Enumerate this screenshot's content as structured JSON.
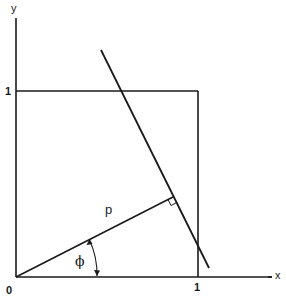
{
  "diagram": {
    "type": "geometry",
    "colors": {
      "stroke": "#1a1a1a",
      "background": "#ffffff"
    },
    "axes": {
      "x_label": "x",
      "y_label": "y",
      "origin_label": "0"
    },
    "ticks": {
      "x_one": "1",
      "y_one": "1"
    },
    "symbols": {
      "distance": "p",
      "angle": "ϕ"
    }
  }
}
